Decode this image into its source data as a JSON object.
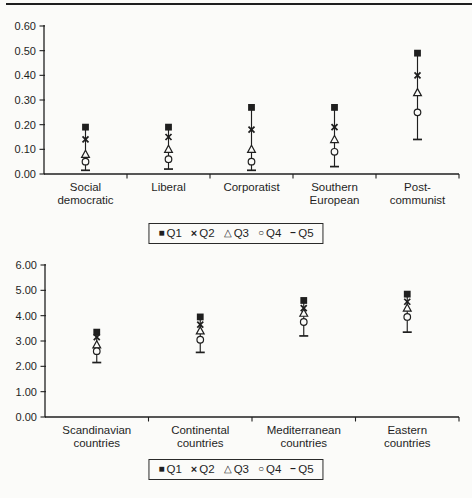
{
  "colors": {
    "ink": "#1f1f1f",
    "paper": "#fbfbf9"
  },
  "legend": {
    "items": [
      {
        "icon": "square-filled-icon",
        "symbol": "■",
        "label": "Q1"
      },
      {
        "icon": "x-marker-icon",
        "symbol": "×",
        "label": "Q2"
      },
      {
        "icon": "triangle-open-icon",
        "symbol": "△",
        "label": "Q3"
      },
      {
        "icon": "circle-open-icon",
        "symbol": "○",
        "label": "Q4"
      },
      {
        "icon": "dash-marker-icon",
        "symbol": "−",
        "label": "Q5"
      }
    ]
  },
  "chart_data": [
    {
      "type": "scatter",
      "title": "",
      "xlabel": "",
      "ylabel": "",
      "ylim": [
        0,
        0.6
      ],
      "ytick_step": 0.1,
      "ytick_decimals": 2,
      "grid": false,
      "legend_position": "bottom",
      "range_bar": true,
      "categories": [
        [
          "Social",
          "democratic"
        ],
        [
          "Liberal"
        ],
        [
          "Corporatist"
        ],
        [
          "Southern",
          "European"
        ],
        [
          "Post-",
          "communist"
        ]
      ],
      "series": [
        {
          "name": "Q1",
          "marker": "filled-square",
          "values": [
            0.19,
            0.19,
            0.27,
            0.27,
            0.49
          ]
        },
        {
          "name": "Q2",
          "marker": "x-cross",
          "values": [
            0.14,
            0.15,
            0.18,
            0.19,
            0.4
          ]
        },
        {
          "name": "Q3",
          "marker": "open-triangle",
          "values": [
            0.08,
            0.1,
            0.1,
            0.14,
            0.33
          ]
        },
        {
          "name": "Q4",
          "marker": "open-circle",
          "values": [
            0.05,
            0.06,
            0.05,
            0.09,
            0.25
          ]
        },
        {
          "name": "Q5",
          "marker": "dash",
          "values": [
            0.015,
            0.02,
            0.015,
            0.03,
            0.14
          ]
        }
      ]
    },
    {
      "type": "scatter",
      "title": "",
      "xlabel": "",
      "ylabel": "",
      "ylim": [
        0,
        6.0
      ],
      "ytick_step": 1.0,
      "ytick_decimals": 2,
      "grid": false,
      "legend_position": "bottom",
      "range_bar": true,
      "categories": [
        [
          "Scandinavian",
          "countries"
        ],
        [
          "Continental",
          "countries"
        ],
        [
          "Mediterranean",
          "countries"
        ],
        [
          "Eastern",
          "countries"
        ]
      ],
      "series": [
        {
          "name": "Q1",
          "marker": "filled-square",
          "values": [
            3.35,
            3.95,
            4.6,
            4.85
          ]
        },
        {
          "name": "Q2",
          "marker": "x-cross",
          "values": [
            3.15,
            3.65,
            4.3,
            4.55
          ]
        },
        {
          "name": "Q3",
          "marker": "open-triangle",
          "values": [
            2.85,
            3.4,
            4.1,
            4.3
          ]
        },
        {
          "name": "Q4",
          "marker": "open-circle",
          "values": [
            2.6,
            3.05,
            3.75,
            3.95
          ]
        },
        {
          "name": "Q5",
          "marker": "dash",
          "values": [
            2.15,
            2.55,
            3.2,
            3.35
          ]
        }
      ]
    }
  ]
}
